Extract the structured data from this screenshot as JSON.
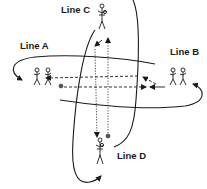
{
  "diagram": {
    "type": "sports-drill-passing-diagram",
    "colors": {
      "background": "#ffffff",
      "ink": "#1a1a1a"
    },
    "lines": [
      {
        "id": "A",
        "label": "Line A",
        "players": 2,
        "has_ball": true
      },
      {
        "id": "B",
        "label": "Line B",
        "players": 2,
        "has_ball": false
      },
      {
        "id": "C",
        "label": "Line C",
        "players": 1,
        "has_ball": false
      },
      {
        "id": "D",
        "label": "Line D",
        "players": 1,
        "has_ball": true
      }
    ],
    "legend": {
      "solid_curve": "player run / rotation path",
      "dashed_arrow": "pass (horizontal)",
      "dotted_arrow": "pass (vertical)"
    }
  },
  "labels": {
    "line_a": "Line A",
    "line_b": "Line B",
    "line_c": "Line C",
    "line_d": "Line D"
  }
}
